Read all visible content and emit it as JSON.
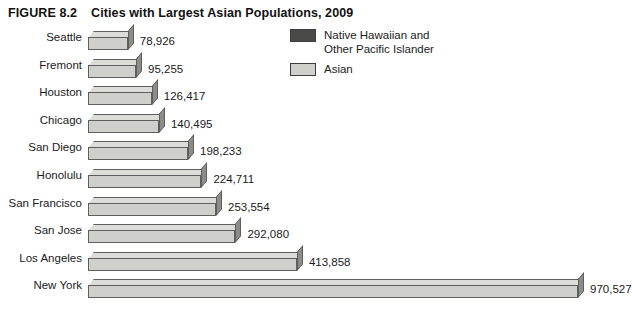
{
  "figure": {
    "number_label": "FIGURE 8.2",
    "title": "Cities with Largest Asian Populations, 2009"
  },
  "legend": {
    "items": [
      {
        "label": "Native Hawaiian and\nOther Pacific Islander",
        "color": "#4a4a48"
      },
      {
        "label": "Asian",
        "color": "#cfcfcc"
      }
    ]
  },
  "chart_data": {
    "type": "bar",
    "orientation": "horizontal",
    "title": "Cities with Largest Asian Populations, 2009",
    "xlabel": "",
    "ylabel": "",
    "grid": false,
    "legend_position": "top-right",
    "xlim": [
      0,
      1000000
    ],
    "categories": [
      "Seattle",
      "Fremont",
      "Houston",
      "Chicago",
      "San Diego",
      "Honolulu",
      "San Francisco",
      "San Jose",
      "Los Angeles",
      "New York"
    ],
    "values": [
      78926,
      95255,
      126417,
      140495,
      198233,
      224711,
      253554,
      292080,
      413858,
      970527
    ],
    "value_labels": [
      "78,926",
      "95,255",
      "126,417",
      "140,495",
      "198,233",
      "224,711",
      "253,554",
      "292,080",
      "413,858",
      "970,527"
    ],
    "series": [
      {
        "name": "Asian",
        "color": "#cfcfcc",
        "values": [
          78926,
          95255,
          126417,
          140495,
          198233,
          224711,
          253554,
          292080,
          413858,
          970527
        ]
      }
    ]
  }
}
